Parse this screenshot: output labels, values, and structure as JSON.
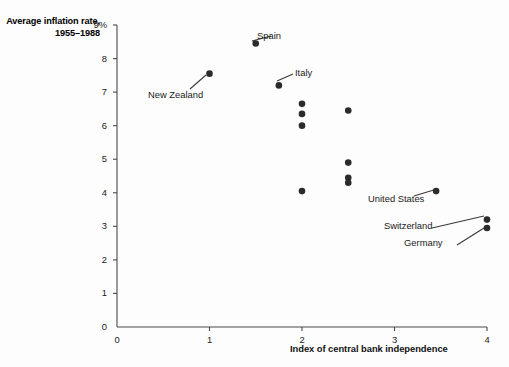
{
  "chart_data": {
    "type": "scatter",
    "title": "",
    "ylabel": "Average inflation rate, 1955–1988",
    "xlabel": "Index of central bank independence",
    "xlim": [
      0,
      4
    ],
    "ylim": [
      0,
      9
    ],
    "xticks": [
      "0",
      "1",
      "2",
      "3",
      "4"
    ],
    "xtick_values": [
      0,
      1,
      2,
      3,
      4
    ],
    "yticks": [
      "0",
      "1",
      "2",
      "3",
      "4",
      "5",
      "6",
      "7",
      "8",
      "9%"
    ],
    "ytick_values": [
      0,
      1,
      2,
      3,
      4,
      5,
      6,
      7,
      8,
      9
    ],
    "grid": false,
    "legend": "none",
    "points": [
      {
        "x": 1.5,
        "y": 8.45,
        "label": "Spain"
      },
      {
        "x": 1.0,
        "y": 7.55,
        "label": "New Zealand"
      },
      {
        "x": 1.75,
        "y": 7.2,
        "label": "Italy"
      },
      {
        "x": 2.0,
        "y": 6.65,
        "label": ""
      },
      {
        "x": 2.0,
        "y": 6.35,
        "label": ""
      },
      {
        "x": 2.0,
        "y": 6.0,
        "label": ""
      },
      {
        "x": 2.5,
        "y": 6.45,
        "label": ""
      },
      {
        "x": 2.5,
        "y": 4.9,
        "label": ""
      },
      {
        "x": 2.5,
        "y": 4.45,
        "label": ""
      },
      {
        "x": 2.5,
        "y": 4.3,
        "label": ""
      },
      {
        "x": 2.0,
        "y": 4.05,
        "label": ""
      },
      {
        "x": 3.45,
        "y": 4.05,
        "label": "United States"
      },
      {
        "x": 4.0,
        "y": 3.2,
        "label": "Switzerland"
      },
      {
        "x": 4.0,
        "y": 2.95,
        "label": "Germany"
      }
    ],
    "annotations": [
      {
        "text": "Spain",
        "tx": 257,
        "ty": 30,
        "lx1": 252,
        "ly1": 41,
        "lx2": 271,
        "ly2": 36
      },
      {
        "text": "New Zealand",
        "tx": 148,
        "ty": 89,
        "lx1": 206,
        "ly1": 75,
        "lx2": 190,
        "ly2": 89
      },
      {
        "text": "Italy",
        "tx": 295,
        "ty": 67,
        "lx1": 277,
        "ly1": 81,
        "lx2": 293,
        "ly2": 74
      },
      {
        "text": "United States",
        "tx": 368,
        "ty": 193,
        "lx1": 437,
        "ly1": 189,
        "lx2": 414,
        "ly2": 196
      },
      {
        "text": "Switzerland",
        "tx": 384,
        "ty": 220,
        "lx1": 484,
        "ly1": 216,
        "lx2": 432,
        "ly2": 228
      },
      {
        "text": "Germany",
        "tx": 404,
        "ty": 237,
        "lx1": 484,
        "ly1": 228,
        "lx2": 457,
        "ly2": 245
      }
    ]
  },
  "figure": {
    "y_axis_title": "Average inflation rate, 1955–1988",
    "x_axis_title": "Index of central bank independence",
    "y_unit_suffix": "%"
  }
}
